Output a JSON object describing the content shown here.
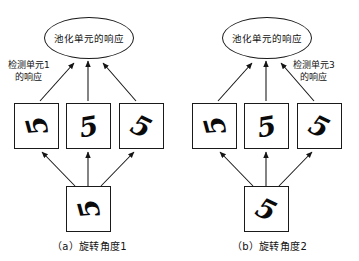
{
  "figure": {
    "background": "#ffffff",
    "stroke_color": "#1a1a1a",
    "text_color": "#111111"
  },
  "panels": [
    {
      "id": "a",
      "caption": "（a）旋转角度1",
      "pooling_unit": {
        "label": "池化单元的响应"
      },
      "annotation": {
        "line1": "检测单元1",
        "line2": "的响应"
      },
      "detector_boxes": [
        {
          "digit": "5",
          "rotation": "-105"
        },
        {
          "digit": "5",
          "rotation": "-10"
        },
        {
          "digit": "5",
          "rotation": "25"
        }
      ],
      "input_box": {
        "digit": "5",
        "rotation": "-105"
      }
    },
    {
      "id": "b",
      "caption": "（b）旋转角度2",
      "pooling_unit": {
        "label": "池化单元的响应"
      },
      "annotation": {
        "line1": "检测单元3",
        "line2": "的响应"
      },
      "detector_boxes": [
        {
          "digit": "5",
          "rotation": "-105"
        },
        {
          "digit": "5",
          "rotation": "-10"
        },
        {
          "digit": "5",
          "rotation": "25"
        }
      ],
      "input_box": {
        "digit": "5",
        "rotation": "25"
      }
    }
  ]
}
